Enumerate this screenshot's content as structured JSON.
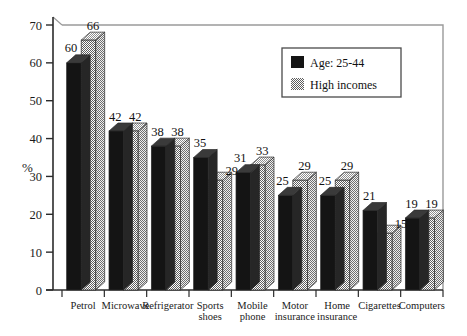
{
  "chart_data": {
    "type": "bar",
    "title": "",
    "subtitle": "",
    "xlabel": "",
    "ylabel": "%",
    "ylim": [
      0,
      70
    ],
    "ytick_values": [
      0,
      10,
      20,
      30,
      40,
      50,
      60,
      70
    ],
    "ytick_labels": [
      "0",
      "10",
      "20",
      "30",
      "40",
      "50",
      "60",
      "70"
    ],
    "grid": false,
    "legend_position": "top-right",
    "three_d": true,
    "categories": [
      "Petrol",
      "Microwave",
      "Refrigerator",
      "Sports shoes",
      "Mobile phone",
      "Motor insurance",
      "Home insurance",
      "Cigarettes",
      "Computers"
    ],
    "category_lines": [
      [
        "Petrol"
      ],
      [
        "Microwave"
      ],
      [
        "Refrigerator"
      ],
      [
        "Sports",
        "shoes"
      ],
      [
        "Mobile",
        "phone"
      ],
      [
        "Motor",
        "insurance"
      ],
      [
        "Home",
        "insurance"
      ],
      [
        "Cigarettes"
      ],
      [
        "Computers"
      ]
    ],
    "series": [
      {
        "name": "Age: 25-44",
        "color": "#141414",
        "pattern": "solid",
        "values": [
          60,
          42,
          38,
          35,
          31,
          25,
          25,
          21,
          19
        ],
        "value_labels": [
          "60",
          "42",
          "38",
          "35",
          "31",
          "25",
          "25",
          "21",
          "19"
        ]
      },
      {
        "name": "High incomes",
        "color": "#8a8a8a",
        "pattern": "checker",
        "values": [
          66,
          42,
          38,
          29,
          33,
          29,
          29,
          15,
          19
        ],
        "value_labels": [
          "66",
          "42",
          "38",
          "29",
          "33",
          "29",
          "29",
          "15",
          "19"
        ]
      }
    ]
  },
  "legend": {
    "items": [
      {
        "label": "Age: 25-44",
        "swatch": "solid-black-swatch"
      },
      {
        "label": "High incomes",
        "swatch": "checker-gray-swatch"
      }
    ]
  },
  "colors": {
    "series_1": "#141414",
    "series_2": "#8a8a8a",
    "axis": "#2b2b2b",
    "frame": "#8d8d8d",
    "background": "#ffffff",
    "text": "#111111"
  }
}
